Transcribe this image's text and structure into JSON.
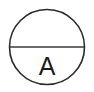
{
  "canvas": {
    "width": 94,
    "height": 92,
    "background_color": "#ffffff"
  },
  "symbol": {
    "name": "ammeter-symbol",
    "description": "Instrument bubble with horizontal dividing line and letter A",
    "stroke_color": "#2b2b2b",
    "chord_color": "#3a3a3a",
    "text_color": "#1c1c1c",
    "circle": {
      "center_x": 47,
      "center_y": 47,
      "radius": 37.5,
      "stroke_width": 1.6
    },
    "chord": {
      "x1": 9.5,
      "y1": 47,
      "x2": 84.5,
      "y2": 47,
      "stroke_width": 1.7
    },
    "label": {
      "text": "A",
      "x": 47,
      "y": 75,
      "font_size": 25
    }
  }
}
